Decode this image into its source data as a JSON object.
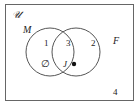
{
  "diagram": {
    "type": "venn",
    "universe_label": "𝒰",
    "sets": [
      {
        "name": "M",
        "label": "M"
      },
      {
        "name": "F",
        "label": "F"
      }
    ],
    "regions": [
      {
        "id": "region-1",
        "label": "1",
        "description": "M only",
        "element": "∅"
      },
      {
        "id": "region-3",
        "label": "3",
        "description": "M and F",
        "element": "J"
      },
      {
        "id": "region-2",
        "label": "2",
        "description": "F only"
      },
      {
        "id": "region-4",
        "label": "4",
        "description": "outside M and F"
      }
    ],
    "empty_set_symbol": "∅",
    "point_label": "J",
    "colors": {
      "stroke": "#555555",
      "background": "#ffffff",
      "text": "#222222"
    }
  }
}
